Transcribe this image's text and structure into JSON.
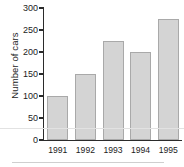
{
  "chart_data": {
    "type": "bar",
    "title": "",
    "subtitle": "",
    "xlabel": "",
    "ylabel": "Number of cars",
    "categories": [
      "1991",
      "1992",
      "1993",
      "1994",
      "1995"
    ],
    "values": [
      100,
      150,
      225,
      200,
      275
    ],
    "series": [
      {
        "name": "Number of cars",
        "values": [
          100,
          150,
          225,
          200,
          275
        ]
      }
    ],
    "ylim": [
      0,
      300
    ],
    "ytick_labels": [
      "0",
      "50",
      "100",
      "150",
      "200",
      "250",
      "300"
    ],
    "ytick_values": [
      0,
      50,
      100,
      150,
      200,
      250,
      300
    ],
    "grid": false,
    "legend": false,
    "legend_position": "none",
    "bar_fill_color": "#d4d4d4",
    "bar_border_color": "#a9a9a9",
    "axis_color": "#2b2b2b",
    "background_color": "#ffffff",
    "text_color": "#1c1c1c"
  }
}
